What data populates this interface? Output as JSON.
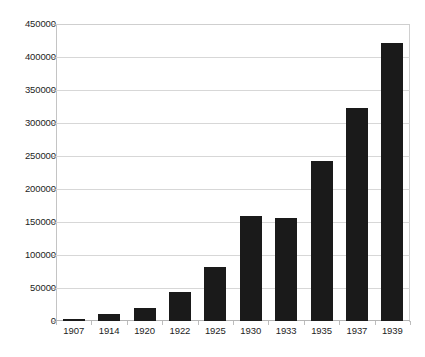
{
  "chart_data": {
    "type": "bar",
    "title": "",
    "subtitle": "",
    "xlabel": "",
    "ylabel": "",
    "categories": [
      "1907",
      "1914",
      "1920",
      "1922",
      "1925",
      "1930",
      "1933",
      "1935",
      "1937",
      "1939"
    ],
    "values": [
      3000,
      10000,
      20000,
      44000,
      82000,
      159000,
      156000,
      242000,
      322000,
      421000
    ],
    "series": [
      {
        "name": "",
        "values": [
          3000,
          10000,
          20000,
          44000,
          82000,
          159000,
          156000,
          242000,
          322000,
          421000
        ]
      }
    ],
    "ylim": [
      0,
      450000
    ],
    "y_ticks": [
      0,
      50000,
      100000,
      150000,
      200000,
      250000,
      300000,
      350000,
      400000,
      450000
    ],
    "y_tick_labels": [
      "0",
      "50000",
      "100000",
      "150000",
      "200000",
      "250000",
      "300000",
      "350000",
      "400000",
      "450000"
    ],
    "grid": true,
    "legend": false,
    "legend_position": "none",
    "bar_color": "#1a1a1a",
    "grid_color": "#d7d7d7",
    "axis_color": "#c4c4c4",
    "background_color": "#ffffff"
  }
}
